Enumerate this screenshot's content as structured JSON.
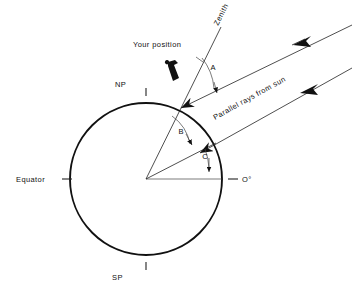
{
  "diagram": {
    "background_color": "#ffffff",
    "ink_color": "#111111",
    "labels": {
      "your_position": "Your position",
      "zenith": "Zenith",
      "parallel_rays": "Parallel rays  from  sun",
      "north_pole": "NP",
      "south_pole": "SP",
      "equator": "Equator",
      "zero_degrees": "O°",
      "angle_a": "A",
      "angle_b": "B",
      "angle_c": "C"
    },
    "icons": {
      "observer": "person-silhouette-icon",
      "ray_arrow": "arrowhead-icon"
    },
    "geometry": {
      "circle_center_x": 146,
      "circle_center_y": 179,
      "circle_radius": 76,
      "zenith_angle_deg": 62,
      "ray_angle_deg": 27,
      "horizon_angle_deg": 0
    }
  }
}
